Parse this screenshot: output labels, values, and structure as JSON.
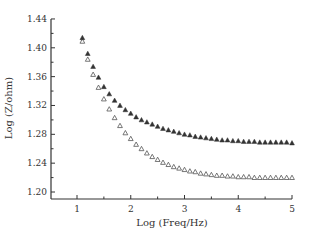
{
  "chart_data": {
    "type": "scatter",
    "title": "",
    "xlabel": "Log (Freq/Hz)",
    "ylabel": "Log (Z/ohm)",
    "xlim": [
      0.52,
      5.0
    ],
    "ylim": [
      1.19,
      1.445
    ],
    "xticks": [
      1,
      2,
      3,
      4,
      5
    ],
    "yticks": [
      1.2,
      1.24,
      1.28,
      1.32,
      1.36,
      1.4,
      1.44
    ],
    "ytick_labels": [
      "1.20",
      "1.24",
      "1.28",
      "1.32",
      "1.36",
      "1.40",
      "1.44"
    ],
    "grid": false,
    "legend": null,
    "x": [
      1.1,
      1.2,
      1.3,
      1.4,
      1.5,
      1.6,
      1.7,
      1.8,
      1.9,
      2.0,
      2.1,
      2.2,
      2.3,
      2.4,
      2.5,
      2.6,
      2.7,
      2.8,
      2.9,
      3.0,
      3.1,
      3.2,
      3.3,
      3.4,
      3.5,
      3.6,
      3.7,
      3.8,
      3.9,
      4.0,
      4.1,
      4.2,
      4.3,
      4.4,
      4.5,
      4.6,
      4.7,
      4.8,
      4.9,
      5.0
    ],
    "series": [
      {
        "name": "filled triangles",
        "marker": "filled-triangle",
        "color": "#333333",
        "values": [
          1.414,
          1.392,
          1.374,
          1.359,
          1.346,
          1.336,
          1.327,
          1.32,
          1.314,
          1.309,
          1.304,
          1.3,
          1.297,
          1.294,
          1.291,
          1.288,
          1.286,
          1.284,
          1.282,
          1.28,
          1.279,
          1.277,
          1.276,
          1.275,
          1.274,
          1.273,
          1.272,
          1.272,
          1.271,
          1.271,
          1.27,
          1.27,
          1.27,
          1.269,
          1.269,
          1.269,
          1.269,
          1.269,
          1.269,
          1.268
        ]
      },
      {
        "name": "open triangles",
        "marker": "open-triangle",
        "color": "#555555",
        "values": [
          1.409,
          1.384,
          1.363,
          1.345,
          1.329,
          1.315,
          1.303,
          1.292,
          1.282,
          1.274,
          1.266,
          1.26,
          1.254,
          1.249,
          1.245,
          1.241,
          1.238,
          1.235,
          1.233,
          1.231,
          1.229,
          1.228,
          1.226,
          1.225,
          1.224,
          1.223,
          1.223,
          1.222,
          1.222,
          1.221,
          1.221,
          1.221,
          1.22,
          1.22,
          1.22,
          1.22,
          1.22,
          1.22,
          1.22,
          1.22
        ]
      }
    ]
  }
}
